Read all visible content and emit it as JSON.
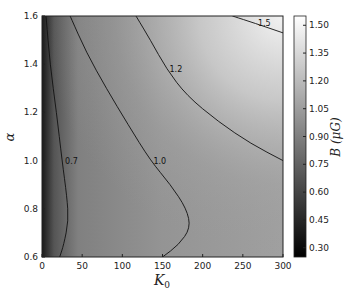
{
  "chart_data": {
    "type": "heatmap",
    "title": "",
    "xlabel": "K_0",
    "ylabel": "α",
    "xlim": [
      0,
      300
    ],
    "ylim": [
      0.6,
      1.6
    ],
    "x_ticks": [
      "0",
      "50",
      "100",
      "150",
      "200",
      "250",
      "300"
    ],
    "y_ticks": [
      "0.6",
      "0.8",
      "1.0",
      "1.2",
      "1.4",
      "1.6"
    ],
    "colormap": "gray",
    "colorbar": {
      "label": "B (μG)",
      "ticks": [
        "0.30",
        "0.45",
        "0.60",
        "0.75",
        "0.90",
        "1.05",
        "1.20",
        "1.35",
        "1.50"
      ],
      "range": [
        0.25,
        1.55
      ]
    },
    "contours": [
      {
        "level": "0.7",
        "points": [
          [
            5,
            1.6
          ],
          [
            10,
            1.4
          ],
          [
            18,
            1.2
          ],
          [
            25,
            1.0
          ],
          [
            31,
            0.85
          ],
          [
            33,
            0.75
          ],
          [
            27,
            0.65
          ],
          [
            22,
            0.6
          ]
        ]
      },
      {
        "level": "1.0",
        "points": [
          [
            35,
            1.6
          ],
          [
            55,
            1.45
          ],
          [
            80,
            1.3
          ],
          [
            107,
            1.15
          ],
          [
            135,
            1.0
          ],
          [
            160,
            0.9
          ],
          [
            180,
            0.8
          ],
          [
            185,
            0.72
          ],
          [
            170,
            0.65
          ],
          [
            150,
            0.6
          ]
        ]
      },
      {
        "level": "1.2",
        "points": [
          [
            117,
            1.6
          ],
          [
            135,
            1.5
          ],
          [
            155,
            1.38
          ],
          [
            180,
            1.27
          ],
          [
            220,
            1.16
          ],
          [
            260,
            1.07
          ],
          [
            300,
            1.0
          ]
        ]
      },
      {
        "level": "1.5",
        "points": [
          [
            237,
            1.6
          ],
          [
            265,
            1.57
          ],
          [
            300,
            1.53
          ]
        ]
      }
    ],
    "grid": false
  }
}
